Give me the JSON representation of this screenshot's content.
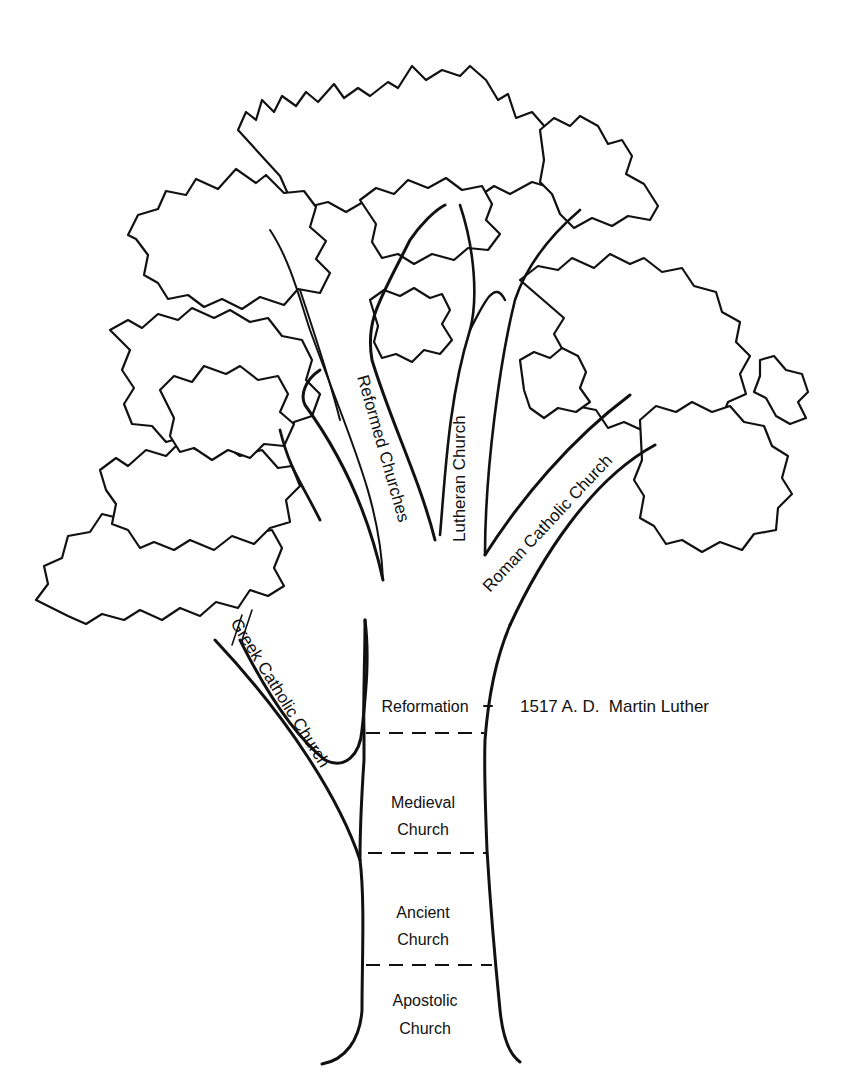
{
  "diagram": {
    "type": "family tree illustration",
    "trunk_eras": [
      {
        "line1": "Reformation",
        "line2": ""
      },
      {
        "line1": "Medieval",
        "line2": "Church"
      },
      {
        "line1": "Ancient",
        "line2": "Church"
      },
      {
        "line1": "Apostolic",
        "line2": "Church"
      }
    ],
    "branches": {
      "greek": "Greek Catholic Church",
      "reformed": "Reformed Churches",
      "lutheran": "Lutheran Church",
      "roman": "Roman Catholic Church"
    },
    "annotation": "1517 A. D.  Martin Luther"
  }
}
